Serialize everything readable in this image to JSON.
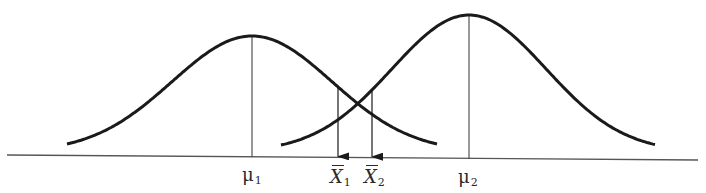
{
  "diagram": {
    "type": "two overlapping normal distributions with sample means",
    "colors": {
      "curve": "#1a1a1a",
      "axis": "#555555",
      "label": "#2a2a2a",
      "background": "#ffffff"
    },
    "axis": {
      "x1": 7,
      "y1": 155,
      "x2": 698,
      "y2": 160
    },
    "curves": [
      {
        "name": "distribution-1",
        "peak_x": 252,
        "peak_y": 36,
        "start_x": 67,
        "start_y": 144,
        "end_x": 438,
        "end_y": 147,
        "mean_label": "μ",
        "mean_sub": "1"
      },
      {
        "name": "distribution-2",
        "peak_x": 469,
        "peak_y": 15,
        "start_x": 281,
        "start_y": 145,
        "end_x": 656,
        "end_y": 149,
        "mean_label": "μ",
        "mean_sub": "2"
      }
    ],
    "sample_means": [
      {
        "name": "x-bar-1",
        "x": 338,
        "label": "X",
        "sub": "1"
      },
      {
        "name": "x-bar-2",
        "x": 372,
        "label": "X",
        "sub": "2"
      }
    ]
  }
}
